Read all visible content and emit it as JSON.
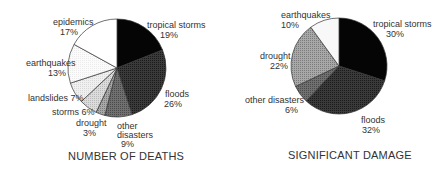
{
  "chart_data": [
    {
      "type": "pie",
      "title": "NUMBER OF DEATHS",
      "categories": [
        "tropical storms",
        "floods",
        "other disasters",
        "drought",
        "storms",
        "landslides",
        "earthquakes",
        "epidemics"
      ],
      "values": [
        19,
        26,
        9,
        3,
        6,
        7,
        13,
        17
      ],
      "labels": [
        "19%",
        "26%",
        "9%",
        "3%",
        "6%",
        "7%",
        "13%",
        "17%"
      ],
      "start_angle_deg": 0,
      "direction": "clockwise",
      "fills": [
        "#0a0a0a",
        "#2e2e2e",
        "#5e5e5e",
        "#8a8a8a",
        "#c8c8c8",
        "#e6e6e6",
        "#f7f7f7",
        "#ffffff"
      ],
      "legend": "none (direct labels)"
    },
    {
      "type": "pie",
      "title": "SIGNIFICANT DAMAGE",
      "categories": [
        "tropical storms",
        "floods",
        "other disasters",
        "drought",
        "earthquakes"
      ],
      "values": [
        30,
        32,
        6,
        22,
        10
      ],
      "labels": [
        "30%",
        "32%",
        "6%",
        "22%",
        "10%"
      ],
      "start_angle_deg": 0,
      "direction": "clockwise",
      "fills": [
        "#0a0a0a",
        "#2e2e2e",
        "#5e5e5e",
        "#9a9a9a",
        "#f7f7f7"
      ],
      "legend": "none (direct labels)"
    }
  ],
  "charts": {
    "left": {
      "title": "NUMBER OF DEATHS",
      "labels": {
        "tropical_storms": [
          "tropical storms",
          "19%"
        ],
        "floods": [
          "floods",
          "26%"
        ],
        "other_disasters": [
          "other",
          "disasters",
          "9%"
        ],
        "drought": [
          "drought",
          "3%"
        ],
        "storms": "storms 6%",
        "landslides": "landslides 7%",
        "earthquakes": [
          "earthquakes",
          "13%"
        ],
        "epidemics": [
          "epidemics",
          "17%"
        ]
      }
    },
    "right": {
      "title": "SIGNIFICANT DAMAGE",
      "labels": {
        "tropical_storms": [
          "tropical storms",
          "30%"
        ],
        "floods": [
          "floods",
          "32%"
        ],
        "other_disasters": [
          "other disasters",
          "6%"
        ],
        "drought": [
          "drought",
          "22%"
        ],
        "earthquakes": [
          "earthquakes",
          "10%"
        ]
      }
    }
  }
}
